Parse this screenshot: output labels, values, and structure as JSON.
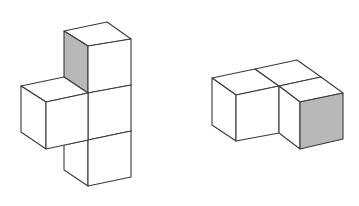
{
  "diagram": {
    "description": "Two isometric cube assemblies: a 4-cube figure on the left and a 3-cube figure on the right, each with one shaded face",
    "colors": {
      "background": "#ffffff",
      "face": "#ffffff",
      "shaded_face": "#b8b8b8",
      "stroke": "#3a3a3a"
    },
    "figures": [
      {
        "name": "left-figure",
        "cube_count": 4,
        "shaded_face": "left face of top cube"
      },
      {
        "name": "right-figure",
        "cube_count": 3,
        "shaded_face": "front face of front-right cube"
      }
    ]
  }
}
